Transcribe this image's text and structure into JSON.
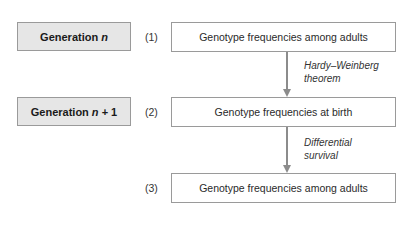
{
  "diagram": {
    "generations": [
      {
        "label_prefix": "Generation",
        "label_var": "n",
        "label_suffix": ""
      },
      {
        "label_prefix": "Generation",
        "label_var": "n",
        "label_suffix": " + 1"
      }
    ],
    "stages": [
      {
        "number": "(1)",
        "text": "Genotype frequencies among adults"
      },
      {
        "number": "(2)",
        "text": "Genotype frequencies at birth"
      },
      {
        "number": "(3)",
        "text": "Genotype frequencies among adults"
      }
    ],
    "transitions": [
      {
        "line1": "Hardy–Weinberg",
        "line2": "theorem"
      },
      {
        "line1": "Differential",
        "line2": "survival"
      }
    ],
    "colors": {
      "generation_fill": "#e6e6e6",
      "border": "#9a9a9a",
      "arrow": "#8c8c8c"
    }
  }
}
